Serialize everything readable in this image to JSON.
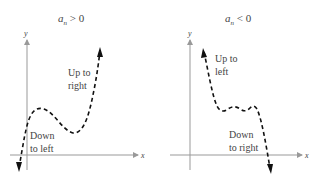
{
  "left_panel": {
    "title_main": "a",
    "title_sub": "n",
    "title_rel": " > 0",
    "y_axis_label": "y",
    "x_axis_label": "x",
    "annotation_top": [
      "Up to",
      "right"
    ],
    "annotation_bottom": [
      "Down",
      "to left"
    ]
  },
  "right_panel": {
    "title_main": "a",
    "title_sub": "n",
    "title_rel": " < 0",
    "y_axis_label": "y",
    "x_axis_label": "x",
    "annotation_top": [
      "Up to",
      "left"
    ],
    "annotation_bottom": [
      "Down",
      "to right"
    ]
  },
  "colors": {
    "axis": "#888888",
    "curve": "#111111",
    "text": "#444444"
  }
}
